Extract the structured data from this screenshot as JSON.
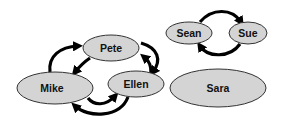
{
  "nodes": [
    {
      "id": "pete",
      "label": "Pete",
      "cx": 111,
      "cy": 48,
      "rx": 28,
      "ry": 13
    },
    {
      "id": "mike",
      "label": "Mike",
      "cx": 55,
      "cy": 88,
      "rx": 38,
      "ry": 16
    },
    {
      "id": "ellen",
      "label": "Ellen",
      "cx": 136,
      "cy": 84,
      "rx": 28,
      "ry": 13
    },
    {
      "id": "sean",
      "label": "Sean",
      "cx": 189,
      "cy": 33,
      "rx": 23,
      "ry": 11
    },
    {
      "id": "sue",
      "label": "Sue",
      "cx": 248,
      "cy": 33,
      "rx": 19,
      "ry": 11
    },
    {
      "id": "sara",
      "label": "Sara",
      "cx": 218,
      "cy": 88,
      "rx": 48,
      "ry": 19
    }
  ],
  "edges": [
    {
      "from": "mike",
      "to": "pete"
    },
    {
      "from": "pete",
      "to": "mike"
    },
    {
      "from": "pete",
      "to": "ellen"
    },
    {
      "from": "ellen",
      "to": "pete"
    },
    {
      "from": "mike",
      "to": "ellen"
    },
    {
      "from": "ellen",
      "to": "mike"
    },
    {
      "from": "sean",
      "to": "sue"
    },
    {
      "from": "sue",
      "to": "sean"
    }
  ],
  "colors": {
    "node_fill": "#d4d4d4",
    "node_stroke": "#333333",
    "arrow": "#000000",
    "background": "#ffffff"
  }
}
